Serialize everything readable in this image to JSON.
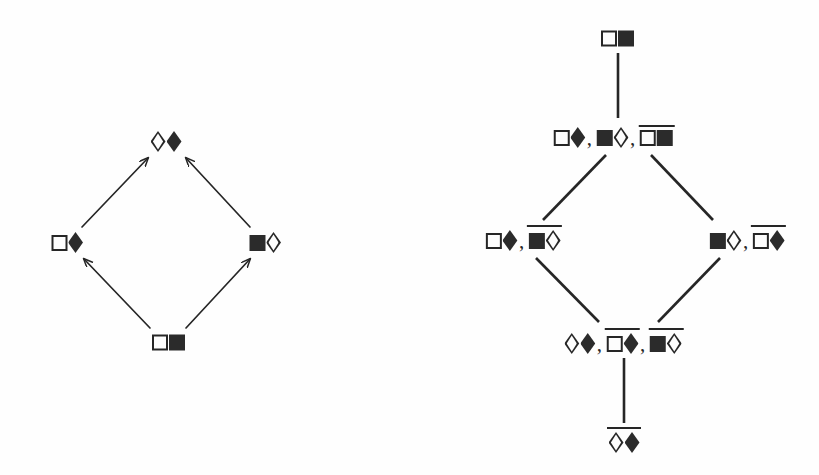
{
  "figure": {
    "background_color": "#fefefe",
    "ink_color": "#262626",
    "glyph_legend": {
      "white-square-icon": "□",
      "black-square-icon": "■",
      "white-diamond-icon": "◇",
      "black-diamond-icon": "◆",
      "overline": "negation bar drawn above a term"
    }
  },
  "left_diagram": {
    "name": "arrow-lattice",
    "edge_style": "arrow",
    "nodes": [
      {
        "id": "L-top",
        "label": "◇◆",
        "x": 166,
        "y": 139,
        "terms": [
          {
            "negated": false,
            "glyphs": [
              "white-diamond",
              "black-diamond"
            ]
          }
        ]
      },
      {
        "id": "L-left",
        "label": "□◆",
        "x": 67,
        "y": 240,
        "terms": [
          {
            "negated": false,
            "glyphs": [
              "white-square",
              "black-diamond"
            ]
          }
        ]
      },
      {
        "id": "L-right",
        "label": "■◇",
        "x": 265,
        "y": 240,
        "terms": [
          {
            "negated": false,
            "glyphs": [
              "black-square",
              "white-diamond"
            ]
          }
        ]
      },
      {
        "id": "L-bottom",
        "label": "□■",
        "x": 168,
        "y": 340,
        "terms": [
          {
            "negated": false,
            "glyphs": [
              "white-square",
              "black-square"
            ]
          }
        ]
      }
    ],
    "edges": [
      {
        "from": "L-left",
        "to": "L-top",
        "x1": 82,
        "y1": 227,
        "x2": 148,
        "y2": 158
      },
      {
        "from": "L-right",
        "to": "L-top",
        "x1": 250,
        "y1": 227,
        "x2": 186,
        "y2": 158
      },
      {
        "from": "L-bottom",
        "to": "L-left",
        "x1": 150,
        "y1": 328,
        "x2": 84,
        "y2": 259
      },
      {
        "from": "L-bottom",
        "to": "L-right",
        "x1": 186,
        "y1": 328,
        "x2": 250,
        "y2": 259
      }
    ]
  },
  "right_diagram": {
    "name": "hasse-lattice",
    "edge_style": "plain-line",
    "nodes": [
      {
        "id": "R-top",
        "label": "□■",
        "x": 207,
        "y": 36,
        "terms": [
          {
            "negated": false,
            "glyphs": [
              "white-square",
              "black-square"
            ]
          }
        ]
      },
      {
        "id": "R-upper",
        "label": "□◆, ■◇, ‾□■‾",
        "x": 203,
        "y": 135,
        "terms": [
          {
            "negated": false,
            "glyphs": [
              "white-square",
              "black-diamond"
            ]
          },
          {
            "negated": false,
            "glyphs": [
              "black-square",
              "white-diamond"
            ]
          },
          {
            "negated": true,
            "glyphs": [
              "white-square",
              "black-square"
            ]
          }
        ]
      },
      {
        "id": "R-left",
        "label": "□◆, ‾■◇‾",
        "x": 113,
        "y": 238,
        "terms": [
          {
            "negated": false,
            "glyphs": [
              "white-square",
              "black-diamond"
            ]
          },
          {
            "negated": true,
            "glyphs": [
              "black-square",
              "white-diamond"
            ]
          }
        ]
      },
      {
        "id": "R-right",
        "label": "■◇, ‾□◆‾",
        "x": 337,
        "y": 238,
        "terms": [
          {
            "negated": false,
            "glyphs": [
              "black-square",
              "white-diamond"
            ]
          },
          {
            "negated": true,
            "glyphs": [
              "white-square",
              "black-diamond"
            ]
          }
        ]
      },
      {
        "id": "R-lower",
        "label": "◇◆, ‾□◆‾, ‾■◇‾",
        "x": 213,
        "y": 341,
        "terms": [
          {
            "negated": false,
            "glyphs": [
              "white-diamond",
              "black-diamond"
            ]
          },
          {
            "negated": true,
            "glyphs": [
              "white-square",
              "black-diamond"
            ]
          },
          {
            "negated": true,
            "glyphs": [
              "black-square",
              "white-diamond"
            ]
          }
        ]
      },
      {
        "id": "R-bottom",
        "label": "‾◇◆‾",
        "x": 214,
        "y": 440,
        "terms": [
          {
            "negated": true,
            "glyphs": [
              "white-diamond",
              "black-diamond"
            ]
          }
        ]
      }
    ],
    "edges": [
      {
        "from": "R-top",
        "to": "R-upper",
        "x1": 208,
        "y1": 53,
        "x2": 208,
        "y2": 118
      },
      {
        "from": "R-upper",
        "to": "R-left",
        "x1": 196,
        "y1": 155,
        "x2": 133,
        "y2": 220
      },
      {
        "from": "R-upper",
        "to": "R-right",
        "x1": 241,
        "y1": 155,
        "x2": 303,
        "y2": 220
      },
      {
        "from": "R-left",
        "to": "R-lower",
        "x1": 126,
        "y1": 258,
        "x2": 189,
        "y2": 322
      },
      {
        "from": "R-right",
        "to": "R-lower",
        "x1": 310,
        "y1": 258,
        "x2": 248,
        "y2": 322
      },
      {
        "from": "R-lower",
        "to": "R-bottom",
        "x1": 214,
        "y1": 358,
        "x2": 214,
        "y2": 423
      }
    ]
  }
}
